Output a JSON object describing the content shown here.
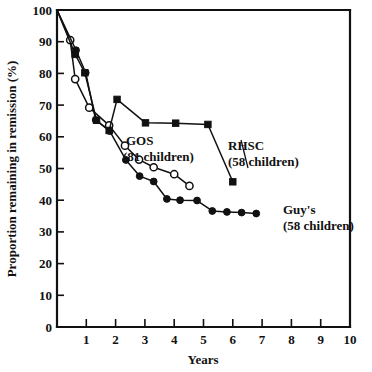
{
  "chart_data": {
    "type": "line",
    "title": "",
    "xlabel": "Years",
    "ylabel": "Proportion remaining in remission (%)",
    "xlim": [
      0,
      10
    ],
    "ylim": [
      0,
      100
    ],
    "xticks": [
      0,
      1,
      2,
      3,
      4,
      5,
      6,
      7,
      8,
      9,
      10
    ],
    "xtick_labels": [
      "",
      "1",
      "2",
      "3",
      "4",
      "5",
      "6",
      "7",
      "8",
      "9",
      "10"
    ],
    "yticks": [
      0,
      10,
      20,
      30,
      40,
      50,
      60,
      70,
      80,
      90,
      100
    ],
    "ytick_labels": [
      "0",
      "10",
      "20",
      "30",
      "40",
      "50",
      "60",
      "70",
      "80",
      "90",
      "100"
    ],
    "grid": false,
    "legend_position": "inline-annotations",
    "series": [
      {
        "name": "GOS",
        "label": "GOS",
        "sublabel": "(81 children)",
        "n_children": 81,
        "marker": "open-circle",
        "color": "#111111",
        "points": [
          [
            0.0,
            100.0
          ],
          [
            0.45,
            90.5
          ],
          [
            0.62,
            78.2
          ],
          [
            1.1,
            69.2
          ],
          [
            1.78,
            63.6
          ],
          [
            2.32,
            57.2
          ],
          [
            2.8,
            52.8
          ],
          [
            3.3,
            50.4
          ],
          [
            4.0,
            48.2
          ],
          [
            4.52,
            44.5
          ]
        ]
      },
      {
        "name": "RHSC",
        "label": "RHSC",
        "sublabel": "(34 children)",
        "n_children": 34,
        "marker": "filled-square",
        "color": "#111111",
        "points": [
          [
            0.0,
            100.0
          ],
          [
            0.62,
            86.0
          ],
          [
            0.95,
            80.2
          ],
          [
            1.35,
            65.2
          ],
          [
            1.78,
            62.0
          ],
          [
            2.05,
            71.8
          ],
          [
            3.02,
            64.4
          ],
          [
            4.05,
            64.3
          ],
          [
            5.15,
            63.9
          ],
          [
            6.0,
            45.8
          ]
        ]
      },
      {
        "name": "Guy's",
        "label": "Guy's",
        "sublabel": "(58 children)",
        "n_children": 58,
        "marker": "filled-circle",
        "color": "#111111",
        "points": [
          [
            0.0,
            100.0
          ],
          [
            0.65,
            87.3
          ],
          [
            0.98,
            80.2
          ],
          [
            1.32,
            65.3
          ],
          [
            1.8,
            61.8
          ],
          [
            2.35,
            52.7
          ],
          [
            2.82,
            47.6
          ],
          [
            3.3,
            45.9
          ],
          [
            3.75,
            40.4
          ],
          [
            4.2,
            40.0
          ],
          [
            4.78,
            39.9
          ],
          [
            5.3,
            36.6
          ],
          [
            5.8,
            36.3
          ],
          [
            6.3,
            36.1
          ],
          [
            6.8,
            35.8
          ]
        ]
      }
    ],
    "annotations": [
      {
        "id": "gos-annotation",
        "text": "GOS",
        "subtext": "(81 children)"
      },
      {
        "id": "rhsc-annotation",
        "text": "RHSC",
        "subtext": "(34 children)"
      },
      {
        "id": "guys-annotation",
        "text": "Guy's",
        "subtext": "(58 children)"
      }
    ]
  }
}
